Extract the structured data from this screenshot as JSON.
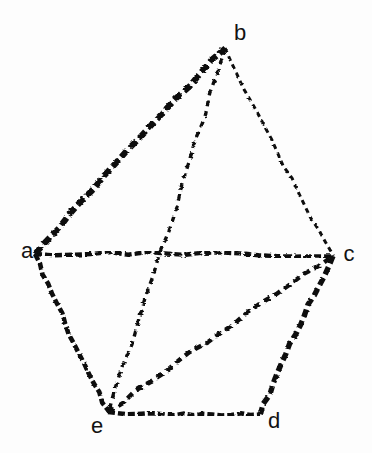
{
  "figure": {
    "type": "graph-diagram",
    "background_color": "#fdfdfd",
    "ink_color": "#101010",
    "width": 372,
    "height": 453
  },
  "vertices": [
    {
      "id": "a",
      "label": "a",
      "x": 35,
      "y": 254,
      "label_x": 27,
      "label_y": 251
    },
    {
      "id": "b",
      "label": "b",
      "x": 225,
      "y": 48,
      "label_x": 240,
      "label_y": 33
    },
    {
      "id": "c",
      "label": "c",
      "x": 333,
      "y": 256,
      "label_x": 349,
      "label_y": 254
    },
    {
      "id": "d",
      "label": "d",
      "x": 260,
      "y": 414,
      "label_x": 274,
      "label_y": 421
    },
    {
      "id": "e",
      "label": "e",
      "x": 108,
      "y": 412,
      "label_x": 97,
      "label_y": 426
    }
  ],
  "edges": [
    {
      "id": "ab",
      "from": "a",
      "to": "b",
      "style": "dashed-heavy",
      "width": 6.2,
      "dash": "9 4"
    },
    {
      "id": "bc",
      "from": "b",
      "to": "c",
      "style": "dashed-light",
      "width": 3.0,
      "dash": "5 4"
    },
    {
      "id": "ac",
      "from": "a",
      "to": "c",
      "style": "dashed-medium",
      "width": 4.4,
      "dash": "7 3"
    },
    {
      "id": "ae",
      "from": "a",
      "to": "e",
      "style": "dashed-medium",
      "width": 4.6,
      "dash": "7 3"
    },
    {
      "id": "be",
      "from": "b",
      "to": "e",
      "style": "dashed-light",
      "width": 3.4,
      "dash": "6 5"
    },
    {
      "id": "ed",
      "from": "e",
      "to": "d",
      "style": "dashed-medium",
      "width": 4.6,
      "dash": "7 3"
    },
    {
      "id": "ec",
      "from": "e",
      "to": "c",
      "style": "dashed-medium",
      "width": 4.4,
      "dash": "7 5"
    },
    {
      "id": "cd",
      "from": "c",
      "to": "d",
      "style": "dashed-heavy",
      "width": 5.4,
      "dash": "8 4"
    }
  ]
}
